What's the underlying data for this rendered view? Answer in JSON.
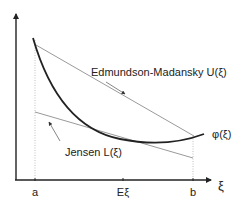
{
  "diagram": {
    "axes": {
      "x_label": "ξ",
      "ticks": [
        {
          "label": "a",
          "x": 35
        },
        {
          "label": "Eξ",
          "x": 123
        },
        {
          "label": "b",
          "x": 193
        }
      ]
    },
    "curves": {
      "phi": {
        "label": "φ(ξ)",
        "color": "#222222"
      },
      "upper": {
        "label": "Edmundson-Madansky U(ξ)",
        "color": "#9a9a9a"
      },
      "lower": {
        "label": "Jensen L(ξ)",
        "color": "#9a9a9a"
      }
    },
    "colors": {
      "axis": "#222222",
      "guide": "#b0b0b0"
    }
  }
}
